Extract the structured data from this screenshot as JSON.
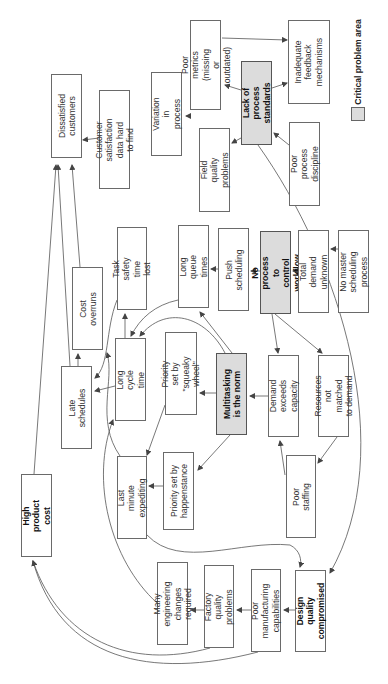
{
  "diagram": {
    "orientation": "rotated 90 degrees counter-clockwise",
    "legend": {
      "label": "Critical problem area",
      "swatch_color": "#dcdcdc"
    },
    "nodes": [
      {
        "id": "dissatisfied",
        "label": "Dissatisfied\ncustomers",
        "critical": false,
        "bold": false,
        "rect": [
          51,
          74,
          31,
          84
        ]
      },
      {
        "id": "cust_sat_data",
        "label": "Customer satisfaction\ndata hard to find",
        "critical": false,
        "bold": false,
        "rect": [
          99,
          90,
          31,
          99
        ]
      },
      {
        "id": "variation",
        "label": "Variation in\nprocess",
        "critical": false,
        "bold": false,
        "rect": [
          151,
          72,
          31,
          84
        ]
      },
      {
        "id": "poor_metrics",
        "label": "Poor metrics\n(missing or outdated)",
        "critical": false,
        "bold": false,
        "rect": [
          190,
          20,
          31,
          90
        ]
      },
      {
        "id": "lack_standards",
        "label": "Lack of process\nstandards",
        "critical": true,
        "bold": true,
        "rect": [
          241,
          61,
          31,
          84
        ]
      },
      {
        "id": "inadequate_feedback",
        "label": "Inadequate\nfeedback\nmechanisms",
        "critical": false,
        "bold": false,
        "rect": [
          288,
          20,
          42,
          84
        ]
      },
      {
        "id": "field_quality",
        "label": "Field quality\nproblems",
        "critical": false,
        "bold": false,
        "rect": [
          199,
          128,
          31,
          84
        ]
      },
      {
        "id": "poor_discipline",
        "label": "Poor process\ndiscipline",
        "critical": false,
        "bold": false,
        "rect": [
          289,
          122,
          31,
          84
        ]
      },
      {
        "id": "cost_overruns",
        "label": "Cost overruns",
        "critical": false,
        "bold": false,
        "rect": [
          72,
          267,
          31,
          83
        ]
      },
      {
        "id": "task_safety",
        "label": "Task safety\ntime lost",
        "critical": false,
        "bold": false,
        "rect": [
          117,
          227,
          30,
          83
        ]
      },
      {
        "id": "long_queue",
        "label": "Long queue times",
        "critical": false,
        "bold": false,
        "rect": [
          178,
          225,
          31,
          83
        ]
      },
      {
        "id": "push_sched",
        "label": "Push scheduling",
        "critical": false,
        "bold": false,
        "rect": [
          218,
          228,
          31,
          83
        ]
      },
      {
        "id": "no_workflow",
        "label": "No process to\ncontrol workflow",
        "critical": true,
        "bold": true,
        "rect": [
          260,
          231,
          31,
          83
        ]
      },
      {
        "id": "total_demand",
        "label": "Total demand\nunknown",
        "critical": false,
        "bold": false,
        "rect": [
          298,
          230,
          31,
          83
        ]
      },
      {
        "id": "no_master",
        "label": "No master\nscheduling process",
        "critical": false,
        "bold": false,
        "rect": [
          338,
          230,
          31,
          83
        ]
      },
      {
        "id": "late_sched",
        "label": "Late schedules",
        "critical": false,
        "bold": false,
        "rect": [
          61,
          366,
          31,
          83
        ]
      },
      {
        "id": "long_cycle",
        "label": "Long cycle time",
        "critical": false,
        "bold": false,
        "rect": [
          115,
          338,
          31,
          83
        ]
      },
      {
        "id": "squeaky",
        "label": "Priority set by\n\"squeaky wheel\"",
        "critical": false,
        "bold": false,
        "rect": [
          165,
          332,
          32,
          83
        ]
      },
      {
        "id": "multitasking",
        "label": "Multitasking\nis the norm",
        "critical": true,
        "bold": true,
        "rect": [
          216,
          353,
          31,
          82
        ]
      },
      {
        "id": "demand_exceeds",
        "label": "Demand exceeds\ncapacity",
        "critical": false,
        "bold": false,
        "rect": [
          268,
          355,
          31,
          82
        ]
      },
      {
        "id": "resources_not",
        "label": "Resources not\nmatched to demand",
        "critical": false,
        "bold": false,
        "rect": [
          318,
          355,
          31,
          82
        ]
      },
      {
        "id": "last_minute",
        "label": "Last minute\nexpediting",
        "critical": false,
        "bold": false,
        "rect": [
          117,
          456,
          30,
          83
        ]
      },
      {
        "id": "happenstance",
        "label": "Priority set by\nhappenstance",
        "critical": false,
        "bold": false,
        "rect": [
          163,
          452,
          31,
          78
        ]
      },
      {
        "id": "poor_staffing",
        "label": "Poor staffing",
        "critical": false,
        "bold": false,
        "rect": [
          286,
          455,
          30,
          83
        ]
      },
      {
        "id": "high_cost",
        "label": "High product\ncost",
        "critical": false,
        "bold": true,
        "rect": [
          21,
          474,
          31,
          83
        ]
      },
      {
        "id": "eng_changes",
        "label": "Many engineering\nchanges required",
        "critical": false,
        "bold": false,
        "rect": [
          157,
          562,
          31,
          83
        ]
      },
      {
        "id": "factory_quality",
        "label": "Factory quality\nproblems",
        "critical": false,
        "bold": false,
        "rect": [
          204,
          565,
          30,
          83
        ]
      },
      {
        "id": "poor_mfg",
        "label": "Poor manufacturing\ncapabilities",
        "critical": false,
        "bold": false,
        "rect": [
          251,
          569,
          30,
          83
        ]
      },
      {
        "id": "design_quality",
        "label": "Design quality\ncompromised",
        "critical": false,
        "bold": true,
        "rect": [
          295,
          570,
          31,
          82
        ]
      }
    ],
    "edges": [
      {
        "from": "cust_sat_data",
        "to": "dissatisfied",
        "d": "M99,138 L83,140"
      },
      {
        "from": "late_sched",
        "to": "dissatisfied",
        "d": "M70,366 L58,165"
      },
      {
        "from": "cost_overruns",
        "to": "dissatisfied",
        "d": "M80,267 L72,165"
      },
      {
        "from": "high_cost",
        "to": "dissatisfied",
        "d": "M34,474 L56,165"
      },
      {
        "from": "poor_metrics",
        "to": "variation",
        "d": "M190,116 L186,116"
      },
      {
        "from": "lack_standards",
        "to": "poor_metrics",
        "d": "M241,90 L225,85"
      },
      {
        "from": "lack_standards",
        "to": "inadequate_feedback",
        "d": "M272,88 L287,83"
      },
      {
        "from": "lack_standards",
        "to": "field_quality",
        "d": "M241,138 L232,143"
      },
      {
        "from": "poor_discipline",
        "to": "lack_standards",
        "d": "M289,145 L274,133"
      },
      {
        "from": "poor_metrics",
        "to": "inadequate_feedback",
        "d": "M222,38 L287,40"
      },
      {
        "from": "late_sched",
        "to": "cost_overruns",
        "d": "M78,366 L78,354"
      },
      {
        "from": "long_cycle",
        "to": "task_safety",
        "d": "M125,338 L125,314"
      },
      {
        "from": "long_cycle",
        "to": "late_sched",
        "d": "M115,386 L95,391"
      },
      {
        "from": "task_safety",
        "to": "late_sched",
        "d": "M117,300 C105,330 110,365 95,378"
      },
      {
        "from": "long_queue",
        "to": "long_cycle",
        "d": "M178,300 C155,305 140,318 131,336"
      },
      {
        "from": "multitasking",
        "to": "long_cycle",
        "d": "M225,353 C205,315 165,305 140,336"
      },
      {
        "from": "multitasking",
        "to": "long_queue",
        "d": "M232,353 L200,312"
      },
      {
        "from": "multitasking",
        "to": "squeaky",
        "d": "M216,393 L200,393"
      },
      {
        "from": "squeaky",
        "to": "last_minute",
        "d": "M165,405 L147,455"
      },
      {
        "from": "push_sched",
        "to": "long_queue",
        "d": "M218,269 L211,269"
      },
      {
        "from": "no_workflow",
        "to": "push_sched",
        "d": "M260,271 L251,271"
      },
      {
        "from": "total_demand",
        "to": "no_workflow",
        "d": "M298,271 L293,271"
      },
      {
        "from": "no_master",
        "to": "total_demand",
        "d": "M338,249 L331,249"
      },
      {
        "from": "no_workflow",
        "to": "demand_exceeds",
        "d": "M272,314 L278,353"
      },
      {
        "from": "no_workflow",
        "to": "resources_not",
        "d": "M275,314 L322,353"
      },
      {
        "from": "demand_exceeds",
        "to": "multitasking",
        "d": "M268,396 L250,396"
      },
      {
        "from": "multitasking",
        "to": "happenstance",
        "d": "M230,435 L198,470"
      },
      {
        "from": "happenstance",
        "to": "last_minute",
        "d": "M163,486 L149,486"
      },
      {
        "from": "poor_staffing",
        "to": "demand_exceeds",
        "d": "M285,475 L280,441"
      },
      {
        "from": "resources_not",
        "to": "poor_staffing",
        "d": "M337,437 L318,463"
      },
      {
        "from": "last_minute",
        "to": "cost_overruns",
        "d": "M120,456 C95,420 115,380 107,353"
      },
      {
        "from": "last_minute",
        "to": "design_quality",
        "d": "M147,535 C180,570 240,540 290,545 C300,550 302,560 300,567"
      },
      {
        "from": "lack_standards",
        "to": "design_quality",
        "d": "M258,145 C340,260 400,450 330,573"
      },
      {
        "from": "design_quality",
        "to": "poor_mfg",
        "d": "M295,610 L284,610"
      },
      {
        "from": "poor_mfg",
        "to": "factory_quality",
        "d": "M251,610 L237,610"
      },
      {
        "from": "factory_quality",
        "to": "eng_changes",
        "d": "M204,610 L191,610"
      },
      {
        "from": "eng_changes",
        "to": "long_cycle",
        "d": "M157,603 C110,560 90,480 113,420"
      },
      {
        "from": "factory_quality",
        "to": "high_cost",
        "d": "M210,648 C130,670 60,640 33,561"
      },
      {
        "from": "poor_mfg",
        "to": "high_cost",
        "d": "M258,652 C150,680 60,660 33,561"
      }
    ]
  }
}
